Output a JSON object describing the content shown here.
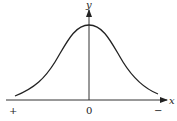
{
  "diagram": {
    "type": "bell-curve",
    "axes": {
      "x_label": "x",
      "y_label": "y",
      "origin_label": "0",
      "left_sign": "+",
      "right_sign": "−"
    },
    "colors": {
      "stroke": "#222222",
      "background": "#ffffff"
    }
  }
}
